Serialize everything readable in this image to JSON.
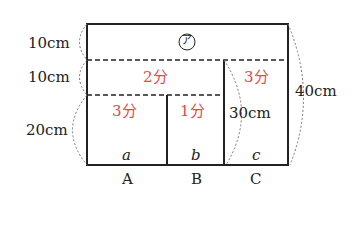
{
  "diagram": {
    "title_mark": "ア",
    "left_dims": [
      "10cm",
      "10cm",
      "20cm"
    ],
    "right_dims": {
      "c_height": "30cm",
      "total": "40cm"
    },
    "times": {
      "section_a_top": "2分",
      "a": "3分",
      "b": "1分",
      "c": "3分"
    },
    "bottom_letters": [
      "a",
      "b",
      "c"
    ],
    "tank_labels": [
      "A",
      "B",
      "C"
    ],
    "colors": {
      "line": "#222222",
      "red": "#e8474a"
    }
  }
}
